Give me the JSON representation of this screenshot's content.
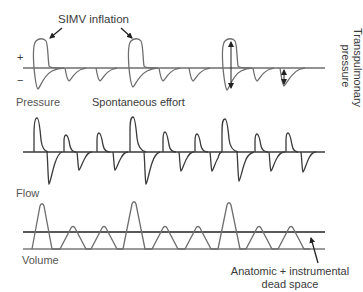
{
  "labels": {
    "simv_inflation": "SIMV inflation",
    "plus_sign": "+",
    "minus_sign": "−",
    "transpulmonary_line1": "Transpulmonary",
    "transpulmonary_line2": "pressure",
    "pressure": "Pressure",
    "spontaneous_effort": "Spontaneous effort",
    "flow": "Flow",
    "volume": "Volume",
    "dead_space_line1": "Anatomic + instrumental",
    "dead_space_line2": "dead space"
  },
  "colors": {
    "pressure_trace": "#6e6e6e",
    "flow_trace": "#3a3a3a",
    "volume_trace": "#7a7a7a",
    "baseline": "#7a7a7a",
    "text": "#3a3a3a"
  },
  "traces": {
    "pressure": {
      "baseline_y": 68,
      "simv_inflations_x": [
        40,
        136,
        230
      ],
      "spontaneous_dips_x": [
        66,
        97,
        160,
        190,
        255
      ]
    },
    "flow": {
      "baseline_y": 152,
      "positive_peaks": [
        {
          "x": 36,
          "height": 34,
          "type": "mandatory"
        },
        {
          "x": 66,
          "height": 17,
          "type": "spontaneous"
        },
        {
          "x": 99,
          "height": 19,
          "type": "spontaneous"
        },
        {
          "x": 132,
          "height": 35,
          "type": "mandatory"
        },
        {
          "x": 165,
          "height": 20,
          "type": "spontaneous"
        },
        {
          "x": 197,
          "height": 18,
          "type": "spontaneous"
        },
        {
          "x": 224,
          "height": 33,
          "type": "mandatory"
        },
        {
          "x": 257,
          "height": 18,
          "type": "spontaneous"
        },
        {
          "x": 288,
          "height": 19,
          "type": "spontaneous"
        }
      ],
      "negative_dips": [
        {
          "x": 49,
          "depth": 32
        },
        {
          "x": 78,
          "depth": 18
        },
        {
          "x": 114,
          "depth": 18
        },
        {
          "x": 146,
          "depth": 32
        },
        {
          "x": 180,
          "depth": 19
        },
        {
          "x": 211,
          "depth": 19
        },
        {
          "x": 239,
          "depth": 29
        },
        {
          "x": 270,
          "depth": 19
        },
        {
          "x": 302,
          "depth": 20
        }
      ]
    },
    "volume": {
      "baseline_y": 249,
      "dead_space_y": 232,
      "breaths": [
        {
          "x": 42,
          "type": "mandatory"
        },
        {
          "x": 74,
          "type": "spontaneous"
        },
        {
          "x": 104,
          "type": "spontaneous"
        },
        {
          "x": 135,
          "type": "mandatory"
        },
        {
          "x": 169,
          "type": "spontaneous"
        },
        {
          "x": 201,
          "type": "spontaneous"
        },
        {
          "x": 232,
          "type": "mandatory"
        },
        {
          "x": 262,
          "type": "spontaneous"
        },
        {
          "x": 292,
          "type": "spontaneous"
        }
      ]
    }
  }
}
